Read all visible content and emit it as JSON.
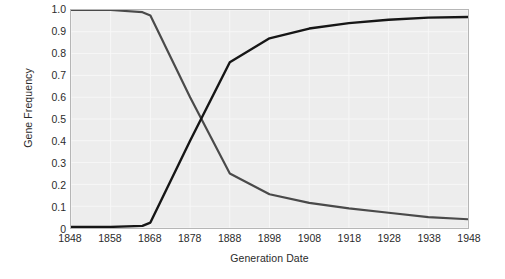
{
  "chart_data": {
    "type": "line",
    "title": "",
    "xlabel": "Generation Date",
    "ylabel": "Gene Frequency",
    "xlim": [
      1848,
      1948
    ],
    "ylim": [
      0,
      1.0
    ],
    "grid": true,
    "legend_position": "none",
    "xticks": [
      "1848",
      "1858",
      "1868",
      "1878",
      "1888",
      "1898",
      "1908",
      "1918",
      "1928",
      "1938",
      "1948"
    ],
    "xtick_values": [
      1848,
      1858,
      1868,
      1878,
      1888,
      1898,
      1908,
      1918,
      1928,
      1938,
      1948
    ],
    "yticks": [
      "1.0",
      "0.9",
      "0.8",
      "0.7",
      "0.6",
      "0.5",
      "0.4",
      "0.3",
      "0.2",
      "0.1",
      "0"
    ],
    "ytick_values": [
      1.0,
      0.9,
      0.8,
      0.7,
      0.6,
      0.5,
      0.4,
      0.3,
      0.2,
      0.1,
      0
    ],
    "series": [
      {
        "name": "typica (light) gene frequency",
        "color": "#4a4a4a",
        "line_width": 2.2,
        "x": [
          1848,
          1858,
          1866,
          1868,
          1878,
          1888,
          1898,
          1908,
          1918,
          1928,
          1938,
          1948
        ],
        "values": [
          1.0,
          1.0,
          0.99,
          0.975,
          0.6,
          0.25,
          0.155,
          0.115,
          0.09,
          0.07,
          0.05,
          0.04
        ]
      },
      {
        "name": "carbonaria (melanic) gene frequency",
        "color": "#161616",
        "line_width": 2.4,
        "x": [
          1848,
          1858,
          1866,
          1868,
          1878,
          1888,
          1898,
          1908,
          1918,
          1928,
          1938,
          1948
        ],
        "values": [
          0.005,
          0.005,
          0.01,
          0.025,
          0.4,
          0.76,
          0.87,
          0.915,
          0.94,
          0.955,
          0.965,
          0.968
        ]
      }
    ],
    "annotations": [
      {
        "name": "melanic-moth-photo",
        "caption": "melanic (carbonaria) peppered moth on lichen-covered bark",
        "x": 1938,
        "y": 0.86
      },
      {
        "name": "typica-moth-photo",
        "caption": "light (typica) peppered moth camouflaged on lichen-covered bark",
        "x": 1938,
        "y": 0.24
      }
    ]
  },
  "style": {
    "plot_background": "#ededed",
    "page_background": "#ffffff",
    "grid_color": "#f7f7f7",
    "frame_color": "#b6b6b6",
    "text_color": "#2b2b2b"
  },
  "icons": {
    "melanic_moth": "dark-moth-icon",
    "typica_moth": "light-moth-icon"
  }
}
